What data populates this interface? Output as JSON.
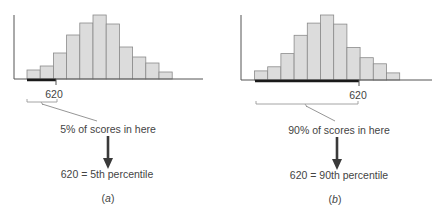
{
  "colors": {
    "bar_fill": "#dcdcdc",
    "bar_stroke": "#8a8a8a",
    "axis": "#555555",
    "highlight": "#1a1a1a",
    "bracket": "#9a9a9a",
    "arrow": "#3a3a3a",
    "text": "#444444"
  },
  "panels": [
    {
      "id": "a",
      "tick_label": "620",
      "region_text": "5% of scores in here",
      "result_text": "620 = 5th percentile",
      "caption": "(a)",
      "caption_letter": "a"
    },
    {
      "id": "b",
      "tick_label": "620",
      "region_text": "90% of scores in here",
      "result_text": "620 = 90th percentile",
      "caption": "(b)",
      "caption_letter": "b"
    }
  ],
  "chart_data": [
    {
      "type": "bar",
      "title": "",
      "xlabel": "",
      "ylabel": "",
      "categories": [
        "1",
        "2",
        "3",
        "4",
        "5",
        "6",
        "7",
        "8",
        "9",
        "10",
        "11"
      ],
      "values": [
        9,
        13,
        26,
        44,
        56,
        64,
        55,
        32,
        22,
        16,
        7
      ],
      "marker": {
        "label": "620",
        "bin_boundary": 2,
        "percentile": 5,
        "shaded_side": "left"
      },
      "grid": false
    },
    {
      "type": "bar",
      "title": "",
      "xlabel": "",
      "ylabel": "",
      "categories": [
        "1",
        "2",
        "3",
        "4",
        "5",
        "6",
        "7",
        "8",
        "9",
        "10",
        "11"
      ],
      "values": [
        9,
        13,
        26,
        44,
        56,
        64,
        55,
        32,
        22,
        16,
        7
      ],
      "marker": {
        "label": "620",
        "bin_boundary": 8,
        "percentile": 90,
        "shaded_side": "left"
      },
      "grid": false
    }
  ]
}
